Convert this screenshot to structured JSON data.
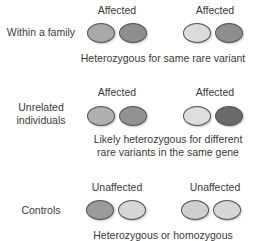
{
  "rows": [
    {
      "label": "Within a family",
      "pairs": [
        {
          "status": "Affected",
          "alleles": [
            "#a9a9a9",
            "#8e8e8e"
          ]
        },
        {
          "status": "Affected",
          "alleles": [
            "#dcdcdc",
            "#8e8e8e"
          ]
        }
      ],
      "caption": "Heterozygous for same rare variant"
    },
    {
      "label_line1": "Unrelated",
      "label_line2": "individuals",
      "pairs": [
        {
          "status": "Affected",
          "alleles": [
            "#b0b0b0",
            "#929292"
          ]
        },
        {
          "status": "Affected",
          "alleles": [
            "#dedede",
            "#6a6a6a"
          ]
        }
      ],
      "caption_line1": "Likely heterozygous for different",
      "caption_line2": "rare variants in the same gene"
    },
    {
      "label": "Controls",
      "pairs": [
        {
          "status": "Unaffected",
          "alleles": [
            "#9a9a9a",
            "#d6d6d6"
          ]
        },
        {
          "status": "Unaffected",
          "alleles": [
            "#cfcfcf",
            "#d6d6d6"
          ]
        }
      ],
      "caption": "Heterozygous or homozygous"
    }
  ]
}
